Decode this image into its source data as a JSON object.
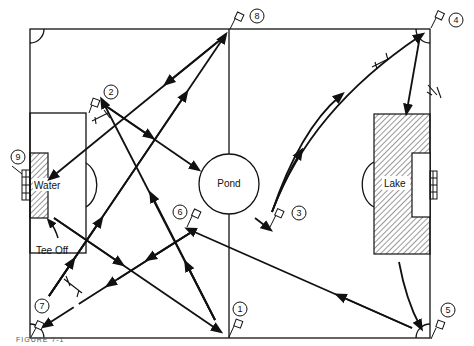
{
  "diagram": {
    "labels": {
      "pond": "Pond",
      "lake": "Lake",
      "water": "Water",
      "tee_off": "Tee Off"
    },
    "holes": [
      {
        "number": "1",
        "x": 240,
        "y": 322
      },
      {
        "number": "2",
        "x": 111,
        "y": 92
      },
      {
        "number": "3",
        "x": 299,
        "y": 212
      },
      {
        "number": "4",
        "x": 456,
        "y": 20
      },
      {
        "number": "5",
        "x": 448,
        "y": 310
      },
      {
        "number": "6",
        "x": 180,
        "y": 212
      },
      {
        "number": "7",
        "x": 42,
        "y": 306
      },
      {
        "number": "8",
        "x": 257,
        "y": 18
      },
      {
        "number": "9",
        "x": 18,
        "y": 157
      }
    ],
    "caption": "FIGURE 7-1"
  }
}
